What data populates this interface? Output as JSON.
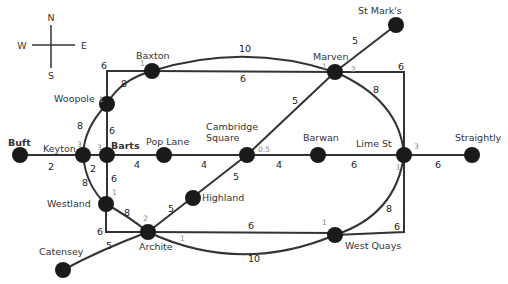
{
  "diagram": {
    "type": "network map",
    "compass": {
      "north": "N",
      "south": "S",
      "east": "E",
      "west": "W"
    },
    "stations": [
      {
        "id": "buft",
        "name": "Buft",
        "x": 20,
        "y": 155
      },
      {
        "id": "keyton",
        "name": "Keyton",
        "x": 83,
        "y": 155,
        "penalty": "3"
      },
      {
        "id": "barts",
        "name": "Barts",
        "x": 107,
        "y": 155,
        "penalty": "3"
      },
      {
        "id": "woopole",
        "name": "Woopole",
        "x": 107,
        "y": 104,
        "penalty": "1"
      },
      {
        "id": "baxton",
        "name": "Baxton",
        "x": 152,
        "y": 71,
        "penalty": "1"
      },
      {
        "id": "marven",
        "name": "Marven",
        "x": 335,
        "y": 72,
        "penalty": "1",
        "penalty2": "2"
      },
      {
        "id": "st_marks",
        "name": "St Mark's",
        "x": 396,
        "y": 25
      },
      {
        "id": "pop_lane",
        "name": "Pop Lane",
        "x": 164,
        "y": 155
      },
      {
        "id": "cambridge_square",
        "name_line1": "Cambridge",
        "name_line2": "Square",
        "x": 247,
        "y": 155,
        "penalty": "0.5"
      },
      {
        "id": "barwan",
        "name": "Barwan",
        "x": 318,
        "y": 155
      },
      {
        "id": "lime_st",
        "name": "Lime St",
        "x": 404,
        "y": 155,
        "penalty": "3",
        "penalty2": "1"
      },
      {
        "id": "straightly",
        "name": "Straightly",
        "x": 472,
        "y": 155
      },
      {
        "id": "westland",
        "name": "Westland",
        "x": 106,
        "y": 204,
        "penalty": "1"
      },
      {
        "id": "highland",
        "name": "Highland",
        "x": 193,
        "y": 198
      },
      {
        "id": "archite",
        "name": "Archite",
        "x": 148,
        "y": 232,
        "penalty": "2",
        "penalty2": "1"
      },
      {
        "id": "west_quays",
        "name": "West Quays",
        "x": 335,
        "y": 235,
        "penalty": "1"
      },
      {
        "id": "catensey",
        "name": "Catensey",
        "x": 63,
        "y": 270
      }
    ],
    "edges": [
      {
        "from": "Buft",
        "to": "Keyton",
        "weight": "2"
      },
      {
        "from": "Keyton",
        "to": "Barts",
        "weight": ""
      },
      {
        "from": "Keyton",
        "to": "Westland",
        "weight": "2"
      },
      {
        "from": "Woopole",
        "to": "Keyton",
        "weight": "8"
      },
      {
        "from": "Keyton",
        "to": "Westland (curve)",
        "weight": "8"
      },
      {
        "from": "Woopole",
        "to": "Baxton",
        "weight": "8"
      },
      {
        "from": "Woopole",
        "to": "Baxton (via corner)",
        "weight": "6"
      },
      {
        "from": "Woopole",
        "to": "Barts",
        "weight": "6"
      },
      {
        "from": "Barts",
        "to": "Westland",
        "weight": "6"
      },
      {
        "from": "Barts",
        "to": "Pop Lane",
        "weight": "4"
      },
      {
        "from": "Pop Lane",
        "to": "Cambridge Square",
        "weight": "4"
      },
      {
        "from": "Cambridge Square",
        "to": "Barwan",
        "weight": "4"
      },
      {
        "from": "Barwan",
        "to": "Lime St",
        "weight": "6"
      },
      {
        "from": "Lime St",
        "to": "Straightly",
        "weight": "6"
      },
      {
        "from": "Baxton",
        "to": "Marven",
        "weight": "10"
      },
      {
        "from": "Baxton",
        "to": "Marven (straight)",
        "weight": "6"
      },
      {
        "from": "Marven",
        "to": "St Mark's",
        "weight": "5"
      },
      {
        "from": "Marven",
        "to": "Lime St (via corner)",
        "weight": "6"
      },
      {
        "from": "Marven",
        "to": "Lime St (curve)",
        "weight": "8"
      },
      {
        "from": "Marven",
        "to": "Cambridge Square",
        "weight": "5"
      },
      {
        "from": "Cambridge Square",
        "to": "Highland",
        "weight": "5"
      },
      {
        "from": "Highland",
        "to": "Archite",
        "weight": "5"
      },
      {
        "from": "Westland",
        "to": "Archite",
        "weight": "8"
      },
      {
        "from": "Westland",
        "to": "Archite (via corner)",
        "weight": "6"
      },
      {
        "from": "Archite",
        "to": "Catensey",
        "weight": "5"
      },
      {
        "from": "Archite",
        "to": "West Quays",
        "weight": "6"
      },
      {
        "from": "Archite",
        "to": "West Quays (curve)",
        "weight": "10"
      },
      {
        "from": "West Quays",
        "to": "Lime St (curve)",
        "weight": "8"
      },
      {
        "from": "West Quays",
        "to": "Lime St (via corner)",
        "weight": "6"
      }
    ],
    "weight_labels": {
      "buft_keyton": "2",
      "keyton_westland_inner": "2",
      "woopole_keyton": "8",
      "keyton_westland_curve": "8",
      "woopole_baxton_curve": "8",
      "woopole_corner": "6",
      "woopole_barts": "6",
      "barts_westland": "6",
      "barts_poplane": "4",
      "poplane_cambridge": "4",
      "cambridge_barwan": "4",
      "barwan_limest": "6",
      "limest_straightly": "6",
      "baxton_marven_arc": "10",
      "baxton_marven_straight": "6",
      "marven_stmarks": "5",
      "marven_corner": "6",
      "marven_limest_curve": "8",
      "marven_cambridge": "5",
      "cambridge_highland": "5",
      "highland_archite": "5",
      "westland_archite": "8",
      "westland_corner": "6",
      "archite_catensey": "5",
      "archite_westquays": "6",
      "archite_westquays_arc": "10",
      "westquays_limest_curve": "8",
      "westquays_corner": "6"
    }
  }
}
